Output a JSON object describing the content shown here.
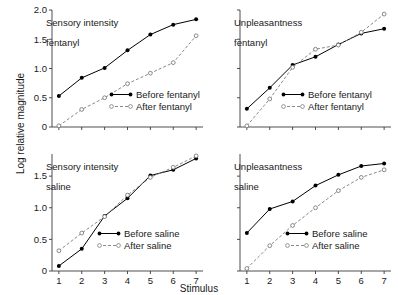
{
  "figure": {
    "ylabel": "Log relative magnitude",
    "xlabel": "Stimulus"
  },
  "chart_data": [
    {
      "type": "line",
      "panel_id": "top-left",
      "title": "Sensory intensity\nfentanyl",
      "title_line1": "Sensory intensity",
      "title_line2": "fentanyl",
      "xlabel": "Stimulus",
      "ylabel": "Log relative magnitude",
      "x": [
        1,
        2,
        3,
        4,
        5,
        6,
        7
      ],
      "xtick_labels": [
        "1",
        "2",
        "3",
        "4",
        "5",
        "6",
        "7"
      ],
      "ytick_labels": [
        "0",
        "0.5",
        "1.0",
        "1.5",
        "2.0"
      ],
      "ytick_values": [
        0,
        0.5,
        1.0,
        1.5,
        2.0
      ],
      "xlim": [
        0.7,
        7.3
      ],
      "ylim": [
        0,
        2.0
      ],
      "grid": false,
      "legend_position": "lower-right",
      "series": [
        {
          "name": "Before fentanyl",
          "style": "solid",
          "marker": "filled-circle",
          "values": [
            0.53,
            0.84,
            1.01,
            1.31,
            1.58,
            1.75,
            1.84
          ]
        },
        {
          "name": "After fentanyl",
          "style": "dashed",
          "marker": "open-circle",
          "values": [
            0.02,
            0.3,
            0.5,
            0.74,
            0.92,
            1.1,
            1.56
          ]
        }
      ]
    },
    {
      "type": "line",
      "panel_id": "top-right",
      "title": "Unpleasantness\nfentanyl",
      "title_line1": "Unpleasantness",
      "title_line2": "fentanyl",
      "xlabel": "Stimulus",
      "ylabel": "Log relative magnitude",
      "x": [
        1,
        2,
        3,
        4,
        5,
        6,
        7
      ],
      "xtick_labels": [
        "1",
        "2",
        "3",
        "4",
        "5",
        "6",
        "7"
      ],
      "ytick_labels": [
        "0",
        "0.5",
        "1.0",
        "1.5",
        "2.0"
      ],
      "ytick_values": [
        0,
        0.5,
        1.0,
        1.5,
        2.0
      ],
      "xlim": [
        0.7,
        7.3
      ],
      "ylim": [
        0,
        2.0
      ],
      "grid": false,
      "legend_position": "lower-right",
      "series": [
        {
          "name": "Before fentanyl",
          "style": "solid",
          "marker": "filled-circle",
          "values": [
            0.31,
            0.67,
            1.06,
            1.2,
            1.41,
            1.6,
            1.68
          ]
        },
        {
          "name": "After fentanyl",
          "style": "dashed",
          "marker": "open-circle",
          "values": [
            0.02,
            0.48,
            1.02,
            1.33,
            1.4,
            1.62,
            1.93
          ]
        }
      ]
    },
    {
      "type": "line",
      "panel_id": "bottom-left",
      "title": "Sensory intensity\nsaline",
      "title_line1": "Sensory intensity",
      "title_line2": "saline",
      "xlabel": "Stimulus",
      "ylabel": "Log relative magnitude",
      "x": [
        1,
        2,
        3,
        4,
        5,
        6,
        7
      ],
      "xtick_labels": [
        "1",
        "2",
        "3",
        "4",
        "5",
        "6",
        "7"
      ],
      "ytick_labels": [
        "0",
        "0.5",
        "1.0",
        "1.5"
      ],
      "ytick_values": [
        0,
        0.5,
        1.0,
        1.5
      ],
      "xlim": [
        0.7,
        7.3
      ],
      "ylim": [
        0,
        1.85
      ],
      "grid": false,
      "legend_position": "lower-right",
      "series": [
        {
          "name": "Before saline",
          "style": "solid",
          "marker": "filled-circle",
          "values": [
            0.08,
            0.35,
            0.87,
            1.15,
            1.51,
            1.6,
            1.78
          ]
        },
        {
          "name": "After saline",
          "style": "dashed",
          "marker": "open-circle",
          "values": [
            0.32,
            0.6,
            0.86,
            1.2,
            1.48,
            1.64,
            1.82
          ]
        }
      ]
    },
    {
      "type": "line",
      "panel_id": "bottom-right",
      "title": "Unpleasantness\nsaline",
      "title_line1": "Unpleasantness",
      "title_line2": "saline",
      "xlabel": "Stimulus",
      "ylabel": "Log relative magnitude",
      "x": [
        1,
        2,
        3,
        4,
        5,
        6,
        7
      ],
      "xtick_labels": [
        "1",
        "2",
        "3",
        "4",
        "5",
        "6",
        "7"
      ],
      "ytick_labels": [
        "0",
        "0.5",
        "1.0",
        "1.5"
      ],
      "ytick_values": [
        0,
        0.5,
        1.0,
        1.5
      ],
      "xlim": [
        0.7,
        7.3
      ],
      "ylim": [
        0,
        1.85
      ],
      "grid": false,
      "legend_position": "lower-right",
      "series": [
        {
          "name": "Before saline",
          "style": "solid",
          "marker": "filled-circle",
          "values": [
            0.6,
            0.98,
            1.1,
            1.35,
            1.52,
            1.66,
            1.7
          ]
        },
        {
          "name": "After saline",
          "style": "dashed",
          "marker": "open-circle",
          "values": [
            0.04,
            0.4,
            0.72,
            1.0,
            1.27,
            1.48,
            1.6
          ]
        }
      ]
    }
  ],
  "colors": {
    "ink": "#1a1a1a",
    "before": "#000000",
    "after": "#7a7a7a",
    "background": "#ffffff"
  }
}
